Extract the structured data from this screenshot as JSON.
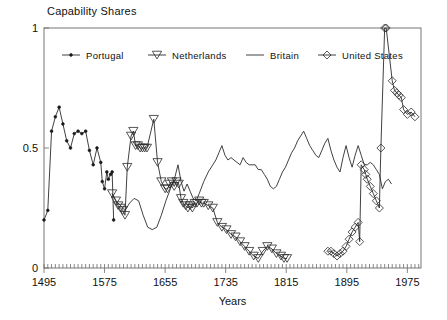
{
  "chart_data": {
    "type": "line",
    "title": "Capability Shares",
    "xlabel": "Years",
    "ylabel": "",
    "xlim": [
      1495,
      1993
    ],
    "ylim": [
      0,
      1
    ],
    "xticks": [
      1495,
      1575,
      1655,
      1735,
      1815,
      1895,
      1975
    ],
    "xticklabels": [
      "1495",
      "1575",
      "1655",
      "1735",
      "1815",
      "1895",
      "1975"
    ],
    "yticks": [
      0,
      0.5,
      1
    ],
    "yticklabels": [
      "0",
      "0.5",
      "1"
    ],
    "minor_tick_step": 5,
    "grid": false,
    "legend_position": "top-inside",
    "series": [
      {
        "name": "Portugal",
        "marker": "dot",
        "color": "#2b2b2b",
        "points": [
          [
            1495,
            0.2
          ],
          [
            1500,
            0.24
          ],
          [
            1505,
            0.57
          ],
          [
            1510,
            0.63
          ],
          [
            1515,
            0.67
          ],
          [
            1520,
            0.6
          ],
          [
            1525,
            0.53
          ],
          [
            1530,
            0.5
          ],
          [
            1535,
            0.56
          ],
          [
            1540,
            0.57
          ],
          [
            1545,
            0.56
          ],
          [
            1550,
            0.57
          ],
          [
            1555,
            0.49
          ],
          [
            1560,
            0.43
          ],
          [
            1565,
            0.5
          ],
          [
            1570,
            0.44
          ],
          [
            1572,
            0.36
          ],
          [
            1575,
            0.33
          ],
          [
            1578,
            0.4
          ],
          [
            1580,
            0.37
          ],
          [
            1583,
            0.39
          ],
          [
            1585,
            0.4
          ],
          [
            1587,
            0.2
          ]
        ]
      },
      {
        "name": "Netherlands",
        "marker": "triangle-down",
        "color": "#2b2b2b",
        "points": [
          [
            1585,
            0.31
          ],
          [
            1590,
            0.28
          ],
          [
            1593,
            0.26
          ],
          [
            1596,
            0.25
          ],
          [
            1599,
            0.24
          ],
          [
            1602,
            0.22
          ],
          [
            1605,
            0.42
          ],
          [
            1610,
            0.55
          ],
          [
            1613,
            0.57
          ],
          [
            1616,
            0.51
          ],
          [
            1619,
            0.51
          ],
          [
            1622,
            0.5
          ],
          [
            1625,
            0.5
          ],
          [
            1628,
            0.5
          ],
          [
            1631,
            0.5
          ],
          [
            1640,
            0.62
          ],
          [
            1645,
            0.44
          ],
          [
            1650,
            0.36
          ],
          [
            1655,
            0.33
          ],
          [
            1658,
            0.33
          ],
          [
            1661,
            0.35
          ],
          [
            1664,
            0.36
          ],
          [
            1667,
            0.34
          ],
          [
            1670,
            0.36
          ],
          [
            1673,
            0.35
          ],
          [
            1676,
            0.29
          ],
          [
            1679,
            0.27
          ],
          [
            1682,
            0.26
          ],
          [
            1685,
            0.25
          ],
          [
            1688,
            0.26
          ],
          [
            1691,
            0.25
          ],
          [
            1694,
            0.27
          ],
          [
            1697,
            0.27
          ],
          [
            1700,
            0.28
          ],
          [
            1703,
            0.27
          ],
          [
            1706,
            0.27
          ],
          [
            1712,
            0.26
          ],
          [
            1718,
            0.25
          ],
          [
            1724,
            0.19
          ],
          [
            1730,
            0.17
          ],
          [
            1736,
            0.16
          ],
          [
            1742,
            0.14
          ],
          [
            1748,
            0.13
          ],
          [
            1754,
            0.11
          ],
          [
            1760,
            0.09
          ],
          [
            1766,
            0.07
          ],
          [
            1772,
            0.05
          ],
          [
            1778,
            0.04
          ],
          [
            1784,
            0.07
          ],
          [
            1790,
            0.09
          ],
          [
            1796,
            0.08
          ],
          [
            1802,
            0.06
          ],
          [
            1808,
            0.05
          ],
          [
            1812,
            0.04
          ],
          [
            1816,
            0.04
          ]
        ]
      },
      {
        "name": "Britain",
        "marker": "none",
        "color": "#4a4a4a",
        "points": [
          [
            1585,
            0.31
          ],
          [
            1590,
            0.28
          ],
          [
            1596,
            0.26
          ],
          [
            1602,
            0.24
          ],
          [
            1608,
            0.27
          ],
          [
            1614,
            0.29
          ],
          [
            1620,
            0.28
          ],
          [
            1626,
            0.22
          ],
          [
            1632,
            0.17
          ],
          [
            1638,
            0.16
          ],
          [
            1644,
            0.17
          ],
          [
            1650,
            0.22
          ],
          [
            1656,
            0.28
          ],
          [
            1662,
            0.33
          ],
          [
            1668,
            0.38
          ],
          [
            1672,
            0.43
          ],
          [
            1676,
            0.36
          ],
          [
            1680,
            0.32
          ],
          [
            1684,
            0.35
          ],
          [
            1688,
            0.32
          ],
          [
            1692,
            0.29
          ],
          [
            1696,
            0.28
          ],
          [
            1700,
            0.31
          ],
          [
            1706,
            0.36
          ],
          [
            1712,
            0.4
          ],
          [
            1718,
            0.43
          ],
          [
            1722,
            0.45
          ],
          [
            1726,
            0.48
          ],
          [
            1730,
            0.51
          ],
          [
            1734,
            0.47
          ],
          [
            1738,
            0.45
          ],
          [
            1742,
            0.46
          ],
          [
            1746,
            0.45
          ],
          [
            1750,
            0.44
          ],
          [
            1754,
            0.43
          ],
          [
            1758,
            0.46
          ],
          [
            1762,
            0.44
          ],
          [
            1766,
            0.43
          ],
          [
            1770,
            0.43
          ],
          [
            1774,
            0.43
          ],
          [
            1778,
            0.41
          ],
          [
            1782,
            0.41
          ],
          [
            1786,
            0.39
          ],
          [
            1790,
            0.37
          ],
          [
            1794,
            0.34
          ],
          [
            1798,
            0.33
          ],
          [
            1802,
            0.34
          ],
          [
            1806,
            0.37
          ],
          [
            1810,
            0.4
          ],
          [
            1814,
            0.42
          ],
          [
            1818,
            0.45
          ],
          [
            1822,
            0.48
          ],
          [
            1826,
            0.5
          ],
          [
            1830,
            0.53
          ],
          [
            1834,
            0.55
          ],
          [
            1838,
            0.57
          ],
          [
            1842,
            0.54
          ],
          [
            1846,
            0.51
          ],
          [
            1850,
            0.49
          ],
          [
            1854,
            0.47
          ],
          [
            1858,
            0.46
          ],
          [
            1862,
            0.49
          ],
          [
            1866,
            0.52
          ],
          [
            1870,
            0.54
          ],
          [
            1874,
            0.49
          ],
          [
            1878,
            0.45
          ],
          [
            1882,
            0.42
          ],
          [
            1886,
            0.4
          ],
          [
            1890,
            0.46
          ],
          [
            1894,
            0.51
          ],
          [
            1898,
            0.46
          ],
          [
            1902,
            0.42
          ],
          [
            1906,
            0.47
          ],
          [
            1910,
            0.51
          ],
          [
            1914,
            0.47
          ],
          [
            1918,
            0.43
          ],
          [
            1922,
            0.43
          ],
          [
            1926,
            0.44
          ],
          [
            1930,
            0.43
          ],
          [
            1934,
            0.41
          ],
          [
            1938,
            0.39
          ],
          [
            1942,
            0.33
          ],
          [
            1946,
            0.36
          ],
          [
            1950,
            0.37
          ],
          [
            1954,
            0.35
          ]
        ]
      },
      {
        "name": "United States",
        "marker": "diamond",
        "color": "#2b2b2b",
        "points": [
          [
            1870,
            0.07
          ],
          [
            1874,
            0.07
          ],
          [
            1878,
            0.06
          ],
          [
            1882,
            0.05
          ],
          [
            1886,
            0.06
          ],
          [
            1890,
            0.07
          ],
          [
            1894,
            0.09
          ],
          [
            1898,
            0.12
          ],
          [
            1902,
            0.15
          ],
          [
            1906,
            0.17
          ],
          [
            1910,
            0.19
          ],
          [
            1912,
            0.11
          ],
          [
            1914,
            0.43
          ],
          [
            1918,
            0.41
          ],
          [
            1920,
            0.39
          ],
          [
            1922,
            0.37
          ],
          [
            1926,
            0.34
          ],
          [
            1930,
            0.31
          ],
          [
            1934,
            0.28
          ],
          [
            1938,
            0.25
          ],
          [
            1940,
            0.5
          ],
          [
            1945,
            1.0
          ],
          [
            1947,
            1.0
          ],
          [
            1955,
            0.78
          ],
          [
            1958,
            0.74
          ],
          [
            1961,
            0.73
          ],
          [
            1964,
            0.72
          ],
          [
            1967,
            0.71
          ],
          [
            1970,
            0.66
          ],
          [
            1975,
            0.64
          ],
          [
            1980,
            0.65
          ],
          [
            1985,
            0.63
          ]
        ]
      }
    ]
  },
  "legend": {
    "items": [
      {
        "label": "Portugal",
        "marker": "dot"
      },
      {
        "label": "Netherlands",
        "marker": "triangle-down"
      },
      {
        "label": "Britain",
        "marker": "none"
      },
      {
        "label": "United States",
        "marker": "diamond"
      }
    ]
  },
  "colors": {
    "line": "#2b2b2b",
    "frame": "#777777",
    "text": "#111111",
    "background": "#ffffff"
  }
}
